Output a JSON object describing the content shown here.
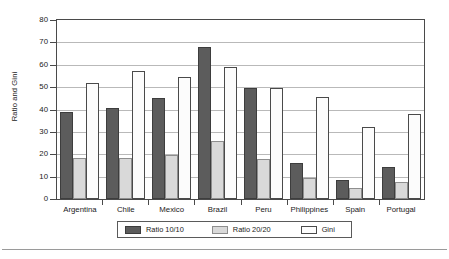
{
  "chart_data": {
    "type": "bar",
    "title": "",
    "subtitle": "",
    "xlabel": "",
    "ylabel": "Ratio and Gini",
    "ylim": [
      0,
      80
    ],
    "yticks": [
      0,
      10,
      20,
      30,
      40,
      50,
      60,
      70,
      80
    ],
    "ytick_labels": [
      "0",
      "10",
      "20",
      "30",
      "40",
      "50",
      "60",
      "70",
      "80"
    ],
    "grid": true,
    "grid_axis": "y",
    "legend_position": "bottom",
    "categories": [
      "Argentina",
      "Chile",
      "Mexico",
      "Brazil",
      "Peru",
      "Philippines",
      "Spain",
      "Portugal"
    ],
    "series": [
      {
        "name": "Ratio 10/10",
        "color": "#5c5c5c",
        "values": [
          39,
          40.5,
          45,
          68,
          49.5,
          16,
          8.5,
          14.5
        ]
      },
      {
        "name": "Ratio 20/20",
        "color": "#d9d9d9",
        "values": [
          18.5,
          18.5,
          19.5,
          26,
          18,
          9.5,
          5,
          7.5
        ]
      },
      {
        "name": "Gini",
        "color": "#fcfcfc",
        "values": [
          52,
          57,
          54.5,
          59,
          49.5,
          45.5,
          32,
          38
        ]
      }
    ]
  }
}
